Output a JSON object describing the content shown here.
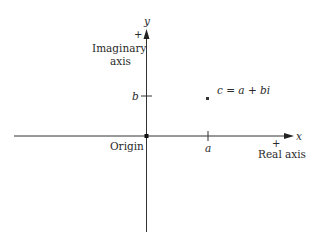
{
  "diagram": {
    "type": "complex-plane",
    "axes": {
      "x": {
        "label": "x",
        "name": "Real axis",
        "positive_marker": "+"
      },
      "y": {
        "label": "y",
        "name_line1": "Imaginary",
        "name_line2": "axis",
        "positive_marker": "+"
      }
    },
    "origin": {
      "label": "Origin"
    },
    "ticks": {
      "x_tick": "a",
      "y_tick": "b"
    },
    "point": {
      "label": "c = a + bi"
    },
    "colors": {
      "line": "#333333",
      "text": "#2a2a2a",
      "background": "#ffffff"
    }
  }
}
